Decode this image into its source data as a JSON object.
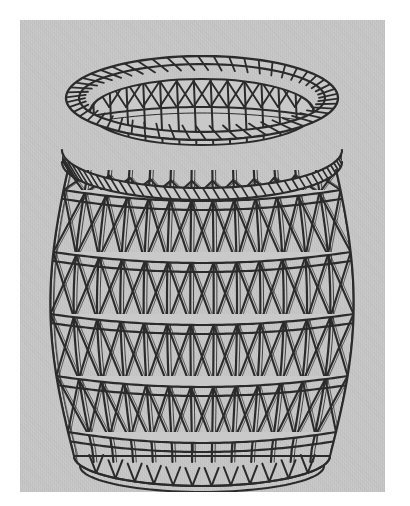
{
  "image": {
    "subject": "woven wicker basket",
    "style": "black line drawing / engraving",
    "panel": {
      "x": 20,
      "y": 20,
      "width": 365,
      "height": 472,
      "background_color": "#c9c9c9",
      "page_color": "#ffffff"
    },
    "ink_color": "#2b2b2b"
  },
  "basket": {
    "center_x": 182,
    "rim": {
      "outer_cx": 182,
      "outer_cy": 78,
      "outer_rx": 136,
      "outer_ry": 42,
      "inner_cx": 182,
      "inner_cy": 92,
      "inner_rx": 112,
      "inner_ry": 33,
      "coil_wraps": 54,
      "coil_band_height": 13
    },
    "neck": {
      "cx": 182,
      "cy": 130,
      "rx": 140,
      "ry": 38,
      "coil_wraps": 46,
      "band_height": 12
    },
    "body": {
      "top_y": 150,
      "bottom_y": 436,
      "max_half_width": 154,
      "min_half_width_top": 134,
      "min_half_width_bottom": 128,
      "stake_count": 13,
      "hoop_count": 5,
      "hoop_positions_y": [
        170,
        232,
        294,
        356,
        412
      ],
      "hoop_curve_depth": 20,
      "hoop_band_height": 9,
      "weave_rows": 5,
      "cross_rows": 5
    },
    "base": {
      "cy": 436,
      "rx": 128,
      "ry": 30
    },
    "interior": {
      "visible": true,
      "far_wall_rows": 2
    }
  },
  "chart_data": null
}
